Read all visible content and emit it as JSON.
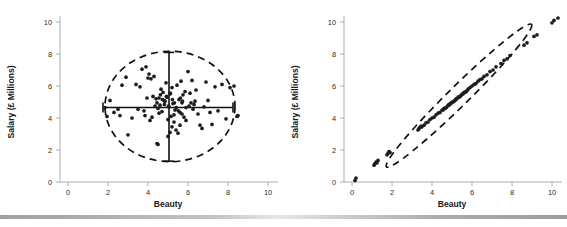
{
  "figure": {
    "background": "#ffffff",
    "point_color": "#1d1d1d",
    "ellipse_color": "#111111",
    "axis_color": "#9a9a9a",
    "bar_label": "footer-gradient-bar"
  },
  "chart_data": [
    {
      "type": "scatter",
      "panel": "left",
      "title": "",
      "xlabel": "Beauty",
      "ylabel": "Salary (£ Millions)",
      "xlim": [
        0,
        10
      ],
      "ylim": [
        0,
        10
      ],
      "xticks": [
        0,
        2,
        4,
        6,
        8,
        10
      ],
      "yticks": [
        0,
        2,
        4,
        6,
        8,
        10
      ],
      "grid": false,
      "legend": "none",
      "annotations": {
        "ellipse": {
          "cx": 5.1,
          "cy": 4.72,
          "rx": 3.25,
          "ry": 3.45,
          "style": "dashed"
        },
        "vertical_whisker": {
          "x": 5.05,
          "y0": 1.3,
          "y1": 8.1
        },
        "horizontal_whisker": {
          "y": 4.66,
          "x0": 1.75,
          "x1": 8.25
        }
      },
      "x": [
        4.5,
        4.8,
        5.1,
        5.3,
        4.9,
        5.0,
        4.6,
        5.2,
        4.7,
        5.05,
        4.95,
        5.15,
        4.75,
        5.25,
        4.85,
        4.4,
        4.55,
        4.65,
        5.35,
        5.45,
        4.35,
        5.55,
        4.3,
        5.6,
        4.25,
        5.65,
        4.2,
        5.7,
        4.15,
        5.75,
        4.1,
        5.85,
        4.05,
        5.9,
        4.0,
        6.0,
        3.95,
        6.1,
        3.9,
        6.2,
        3.85,
        6.3,
        3.8,
        6.4,
        3.7,
        6.5,
        3.6,
        6.6,
        3.5,
        6.7,
        3.4,
        6.8,
        3.2,
        6.9,
        3.0,
        7.0,
        2.9,
        7.1,
        2.7,
        7.2,
        2.6,
        7.35,
        2.5,
        7.5,
        2.3,
        7.7,
        2.1,
        7.9,
        1.95,
        8.1,
        1.85,
        8.3,
        5.0,
        5.1,
        5.2,
        5.3,
        5.4,
        5.5,
        5.6,
        5.7,
        5.8,
        5.9,
        6.05,
        6.15,
        6.25,
        6.35,
        4.45,
        4.55,
        4.62,
        4.72,
        4.82,
        4.92,
        5.02,
        5.12,
        5.22,
        5.32,
        5.42,
        5.52,
        5.62,
        5.72,
        8.45,
        8.5,
        4.45,
        4.5
      ],
      "y": [
        4.6,
        5.1,
        5.5,
        4.2,
        6.2,
        3.9,
        4.8,
        5.9,
        4.4,
        4.7,
        5.3,
        4.1,
        5.6,
        4.9,
        5.05,
        5.2,
        4.3,
        5.8,
        4.5,
        6.05,
        4.75,
        5.15,
        6.6,
        4.35,
        5.35,
        6.3,
        4.05,
        4.95,
        6.45,
        5.45,
        3.85,
        5.65,
        6.75,
        4.65,
        6.5,
        6.9,
        5.25,
        5.55,
        7.2,
        6.35,
        4.15,
        4.85,
        4.45,
        5.75,
        7.05,
        4.25,
        5.95,
        3.55,
        4.55,
        3.35,
        6.1,
        4.7,
        4.0,
        6.25,
        2.95,
        5.1,
        6.55,
        4.35,
        6.05,
        3.6,
        4.15,
        5.95,
        4.55,
        4.45,
        4.35,
        6.1,
        5.1,
        3.95,
        4.1,
        5.9,
        4.65,
        6.0,
        2.85,
        3.1,
        3.45,
        3.75,
        3.25,
        3.05,
        3.55,
        4.25,
        4.05,
        3.85,
        4.75,
        4.95,
        4.55,
        5.05,
        4.95,
        5.25,
        5.45,
        5.15,
        4.85,
        5.35,
        4.75,
        5.55,
        5.15,
        4.95,
        4.65,
        4.45,
        5.25,
        5.05,
        4.1,
        4.15,
        2.4,
        2.35
      ]
    },
    {
      "type": "scatter",
      "panel": "right",
      "title": "",
      "xlabel": "Beauty",
      "ylabel": "Salary (£ Millions)",
      "xlim": [
        0,
        10
      ],
      "ylim": [
        0,
        10
      ],
      "xticks": [
        0,
        2,
        4,
        6,
        8,
        10
      ],
      "yticks": [
        0,
        2,
        4,
        6,
        8,
        10
      ],
      "grid": false,
      "legend": "none",
      "annotations": {
        "ellipse": {
          "cx": 5.35,
          "cy": 5.4,
          "rx": 5.3,
          "ry": 5.55,
          "rotation_deg": -44.5,
          "thickness": 0.62,
          "style": "dashed"
        },
        "relationship": "near-perfect positive correlation along y = x"
      },
      "x": [
        0.15,
        0.2,
        1.1,
        1.15,
        1.2,
        1.25,
        1.3,
        1.75,
        1.8,
        1.85,
        1.9,
        3.3,
        3.35,
        3.4,
        3.45,
        3.5,
        3.6,
        3.7,
        3.8,
        3.9,
        4.0,
        4.1,
        4.2,
        4.3,
        4.4,
        4.5,
        4.6,
        4.7,
        4.8,
        4.9,
        5.0,
        5.1,
        5.2,
        5.3,
        5.4,
        5.5,
        5.6,
        5.7,
        5.8,
        5.9,
        6.0,
        6.1,
        6.2,
        6.3,
        6.4,
        6.5,
        6.6,
        6.75,
        6.9,
        7.05,
        7.2,
        7.45,
        7.6,
        7.75,
        7.9,
        8.6,
        8.75,
        9.1,
        9.25,
        10.0,
        10.1,
        10.3,
        4.55,
        4.65,
        4.75,
        4.85,
        4.95,
        5.05,
        5.15,
        5.25,
        5.35,
        5.45,
        5.55,
        5.65,
        5.75
      ],
      "y": [
        0.1,
        0.25,
        1.05,
        1.15,
        1.25,
        1.2,
        1.35,
        1.7,
        1.8,
        1.9,
        1.85,
        3.25,
        3.35,
        3.4,
        3.5,
        3.45,
        3.55,
        3.7,
        3.75,
        3.9,
        4.0,
        4.05,
        4.2,
        4.3,
        4.35,
        4.5,
        4.6,
        4.65,
        4.8,
        4.9,
        5.0,
        5.05,
        5.2,
        5.3,
        5.35,
        5.5,
        5.6,
        5.65,
        5.8,
        5.9,
        6.0,
        6.1,
        6.15,
        6.3,
        6.4,
        6.45,
        6.6,
        6.7,
        6.9,
        7.0,
        7.2,
        7.4,
        7.6,
        7.7,
        7.9,
        8.55,
        8.7,
        9.1,
        9.2,
        9.95,
        10.1,
        10.25,
        4.5,
        4.6,
        4.7,
        4.8,
        4.9,
        5.0,
        5.1,
        5.2,
        5.3,
        5.4,
        5.5,
        5.6,
        5.7
      ]
    }
  ]
}
